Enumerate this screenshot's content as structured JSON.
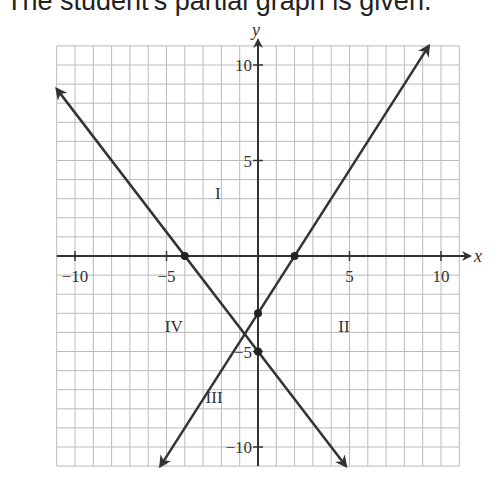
{
  "caption": "The student's partial graph is given.",
  "chart_data": {
    "type": "line",
    "title": "",
    "xlabel": "x",
    "ylabel": "y",
    "xlim": [
      -11,
      11
    ],
    "ylim": [
      -11,
      11
    ],
    "grid": true,
    "x_ticks": [
      -10,
      -5,
      5,
      10
    ],
    "y_ticks": [
      10,
      5,
      -5,
      -10
    ],
    "x_tick_labels": [
      "−10",
      "−5",
      "5",
      "10"
    ],
    "y_tick_labels": [
      "10",
      "5",
      "−5",
      "−10"
    ],
    "series": [
      {
        "name": "line-1",
        "slope": -1.25,
        "intercept": -5,
        "points": [
          [
            -4,
            0
          ],
          [
            0,
            -5
          ]
        ]
      },
      {
        "name": "line-2",
        "slope": 1.5,
        "intercept": -3,
        "points": [
          [
            2,
            0
          ],
          [
            0,
            -3
          ]
        ]
      }
    ],
    "region_labels": [
      {
        "label": "I",
        "x": -2.2,
        "y": 3
      },
      {
        "label": "II",
        "x": 4.7,
        "y": -4
      },
      {
        "label": "III",
        "x": -2.4,
        "y": -7.7
      },
      {
        "label": "IV",
        "x": -4.6,
        "y": -4
      }
    ]
  }
}
